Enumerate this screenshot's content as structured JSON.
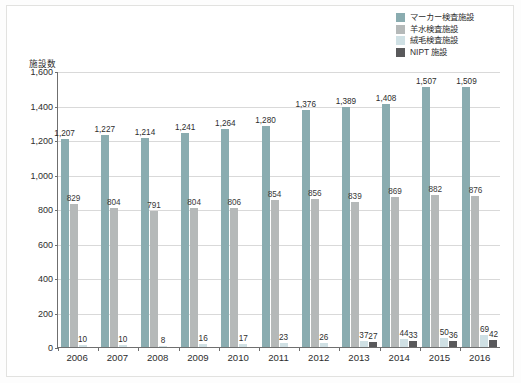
{
  "chart_data": {
    "type": "bar",
    "title": "",
    "xlabel": "",
    "ylabel": "施設数",
    "ylim": [
      0,
      1600
    ],
    "yticks": [
      "0",
      "200",
      "400",
      "600",
      "800",
      "1,000",
      "1,200",
      "1,400",
      "1,600"
    ],
    "grid": true,
    "legend_position": "top-right",
    "categories": [
      "2006",
      "2007",
      "2008",
      "2009",
      "2010",
      "2011",
      "2012",
      "2013",
      "2014",
      "2015",
      "2016"
    ],
    "series": [
      {
        "name": "マーカー検査施設",
        "color": "#8aacb0",
        "values": [
          1207,
          1227,
          1214,
          1241,
          1264,
          1280,
          1376,
          1389,
          1408,
          1507,
          1509
        ],
        "labels": [
          "1,207",
          "1,227",
          "1,214",
          "1,241",
          "1,264",
          "1,280",
          "1,376",
          "1,389",
          "1,408",
          "1,507",
          "1,509"
        ]
      },
      {
        "name": "羊水検査施設",
        "color": "#b5b9b9",
        "values": [
          829,
          804,
          791,
          804,
          806,
          854,
          856,
          839,
          869,
          882,
          876
        ],
        "labels": [
          "829",
          "804",
          "791",
          "804",
          "806",
          "854",
          "856",
          "839",
          "869",
          "882",
          "876"
        ]
      },
      {
        "name": "絨毛検査施設",
        "color": "#cfe0e4",
        "values": [
          10,
          10,
          8,
          16,
          17,
          23,
          26,
          37,
          44,
          50,
          69
        ],
        "labels": [
          "10",
          "10",
          "8",
          "16",
          "17",
          "23",
          "26",
          "37",
          "44",
          "50",
          "69"
        ]
      },
      {
        "name": "NIPT 施設",
        "color": "#59595b",
        "values": [
          null,
          null,
          null,
          null,
          null,
          null,
          null,
          27,
          33,
          36,
          42
        ],
        "labels": [
          "",
          "",
          "",
          "",
          "",
          "",
          "",
          "27",
          "33",
          "36",
          "42"
        ]
      }
    ]
  }
}
